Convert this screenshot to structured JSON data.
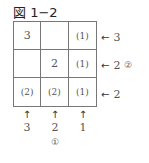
{
  "title": "図 1−2",
  "grid": {
    "rows": [
      [
        "3",
        "",
        "(1)"
      ],
      [
        "",
        "2",
        "(1)"
      ],
      [
        "(2)",
        "(2)",
        "(1)"
      ]
    ]
  },
  "row_labels": [
    {
      "arrow": "←",
      "value": "3",
      "note": ""
    },
    {
      "arrow": "←",
      "value": "2",
      "note": "②"
    },
    {
      "arrow": "←",
      "value": "2",
      "note": ""
    }
  ],
  "col_labels": [
    {
      "arrow": "↑",
      "value": "3",
      "note": ""
    },
    {
      "arrow": "↑",
      "value": "2",
      "note": "①"
    },
    {
      "arrow": "↑",
      "value": "1",
      "note": ""
    }
  ]
}
